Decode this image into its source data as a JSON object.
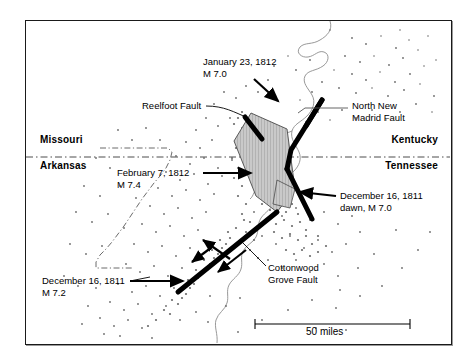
{
  "figure": {
    "type": "map"
  },
  "frame": {
    "border_color": "#1a1a1a",
    "background": "#ffffff"
  },
  "states": [
    {
      "name": "Missouri",
      "side": "left",
      "x": 40,
      "y": 139
    },
    {
      "name": "Arkansas",
      "side": "left",
      "x": 40,
      "y": 161
    },
    {
      "name": "Kentucky",
      "side": "right",
      "x": 438,
      "y": 139
    },
    {
      "name": "Tennessee",
      "side": "right",
      "x": 438,
      "y": 161
    }
  ],
  "annotations": [
    {
      "id": "jan-23-1812",
      "lines": [
        "January 23, 1812",
        "M 7.0"
      ],
      "x": 203,
      "y": 60
    },
    {
      "id": "reelfoot-fault",
      "lines": [
        "Reelfoot Fault"
      ],
      "x": 142,
      "y": 102
    },
    {
      "id": "north-new-madrid-fault",
      "lines": [
        "North New",
        "Madrid Fault"
      ],
      "x": 352,
      "y": 103
    },
    {
      "id": "feb-7-1812",
      "lines": [
        "February 7, 1812",
        "M 7.4"
      ],
      "x": 117,
      "y": 170
    },
    {
      "id": "dec-16-1811-dawn",
      "lines": [
        "December 16, 1811",
        "dawn, M 7.0"
      ],
      "x": 340,
      "y": 194
    },
    {
      "id": "cottonwood-grove-fault",
      "lines": [
        "Cottonwood",
        "Grove Fault"
      ],
      "x": 268,
      "y": 265
    },
    {
      "id": "dec-16-1811",
      "lines": [
        "December 16, 1811",
        "M 7.2"
      ],
      "x": 42,
      "y": 279
    }
  ],
  "scale_bar": {
    "label": "50 miles",
    "x1": 255,
    "x2": 410,
    "y": 324,
    "label_x": 332,
    "label_y": 330
  },
  "colors": {
    "fault_line": "#000000",
    "state_boundary": "#4d4d4d",
    "river": "#8c8c8c",
    "epicenter_dot": "#6b6b6b",
    "shaded_block": "#b3b3b3",
    "text": "#000000"
  },
  "map_features": {
    "faults": [
      {
        "name": "North New Madrid Fault",
        "style": "thick-black-line"
      },
      {
        "name": "Reelfoot Fault",
        "style": "shaded-thrust-block"
      },
      {
        "name": "Cottonwood Grove Fault",
        "style": "thick-black-line-with-strike-slip-arrows"
      }
    ],
    "river": "Mississippi River",
    "epicenters": "scattered small dots concentrated along the fault zone"
  }
}
